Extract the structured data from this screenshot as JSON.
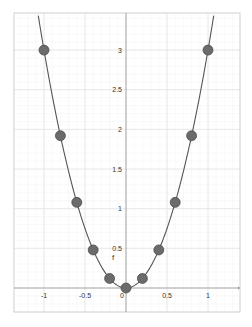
{
  "chart_data": {
    "type": "line",
    "title": "",
    "xlabel": "",
    "ylabel": "",
    "function_label": "f",
    "function": "f(x) = 3x^2",
    "xlim": [
      -1.35,
      1.4
    ],
    "ylim": [
      -0.3,
      3.47
    ],
    "x_ticks": [
      -1,
      -0.5,
      0,
      0.5,
      1
    ],
    "x_tick_labels": [
      "-1",
      "-0.5",
      "0",
      "0.5",
      "1"
    ],
    "y_ticks": [
      0.5,
      1,
      1.5,
      2,
      2.5,
      3
    ],
    "y_tick_labels": [
      "0.5",
      "1",
      "1.5",
      "2",
      "2.5",
      "3"
    ],
    "grid": true,
    "series": [
      {
        "name": "f",
        "kind": "curve",
        "color": "#555555"
      },
      {
        "name": "points",
        "kind": "scatter",
        "color": "#666666",
        "x": [
          -1,
          -0.8,
          -0.6,
          -0.4,
          -0.2,
          0,
          0.2,
          0.4,
          0.6,
          0.8,
          1
        ],
        "y": [
          3,
          1.92,
          1.08,
          0.48,
          0.12,
          0,
          0.12,
          0.48,
          1.08,
          1.92,
          3
        ]
      }
    ]
  },
  "colors": {
    "frame": "#d0d0d0",
    "major_grid": "#e4e4e4",
    "minor_grid": "#f3f3f3",
    "axis": "#999999",
    "curve": "#555555",
    "point_fill": "#6b6b6b",
    "point_stroke": "#444444"
  }
}
